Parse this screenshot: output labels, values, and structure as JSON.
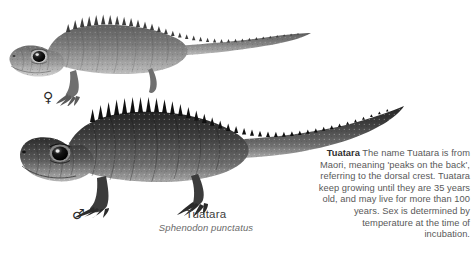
{
  "page": {
    "background_color": "#ffffff",
    "text_color": "#595959"
  },
  "illustrations": [
    {
      "id": "lizard-female",
      "subject": "Tuatara",
      "sex": "female",
      "sex_symbol": "♀",
      "description": "Grayscale scientific illustration of a female tuatara in left profile with spiny dorsal crest and long tapering tail"
    },
    {
      "id": "lizard-male",
      "subject": "Tuatara",
      "sex": "male",
      "sex_symbol": "♂",
      "description": "Grayscale scientific illustration of a larger, darker male tuatara in left profile with prominent spiny dorsal crest"
    }
  ],
  "caption": {
    "common_name": "Tuatara",
    "scientific_name": "Sphenodon punctatus"
  },
  "factbox": {
    "lead": "Tuatara",
    "body": " The name Tuatara is from Maori, meaning 'peaks on the back', referring to the dorsal crest. Tuatara keep growing until they are 35 years old, and may live for more than 100 years. Sex is determined by temperature at the time of incubation."
  }
}
